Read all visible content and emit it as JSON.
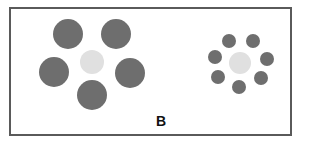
{
  "figure": {
    "label": "B",
    "colors": {
      "outer": "#6e6e6e",
      "center": "#e0e0e0",
      "border": "#5a5a5a"
    },
    "left_cluster": {
      "center": {
        "cx": 92,
        "cy": 62,
        "r": 12
      },
      "surround": [
        {
          "cx": 68,
          "cy": 34,
          "r": 15
        },
        {
          "cx": 116,
          "cy": 34,
          "r": 15
        },
        {
          "cx": 54,
          "cy": 72,
          "r": 15
        },
        {
          "cx": 130,
          "cy": 73,
          "r": 15
        },
        {
          "cx": 92,
          "cy": 95,
          "r": 15
        }
      ]
    },
    "right_cluster": {
      "center": {
        "cx": 240,
        "cy": 63,
        "r": 11
      },
      "surround": [
        {
          "cx": 229,
          "cy": 41,
          "r": 7
        },
        {
          "cx": 253,
          "cy": 41,
          "r": 7
        },
        {
          "cx": 215,
          "cy": 57,
          "r": 7
        },
        {
          "cx": 267,
          "cy": 59,
          "r": 7
        },
        {
          "cx": 218,
          "cy": 77,
          "r": 7
        },
        {
          "cx": 261,
          "cy": 78,
          "r": 7
        },
        {
          "cx": 239,
          "cy": 87,
          "r": 7
        }
      ]
    }
  }
}
